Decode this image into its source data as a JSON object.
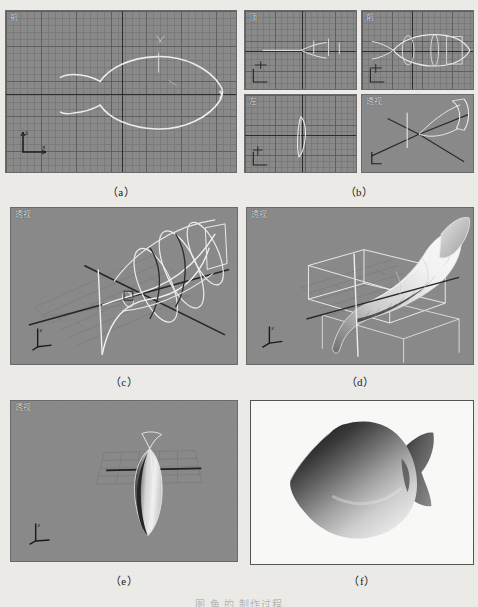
{
  "figure": {
    "panels": [
      {
        "id": "a",
        "caption": "（a）",
        "viewport_label": "前",
        "view_type": "front-orthographic",
        "description": "Front view showing fish outline spline on grid with X/Y axes"
      },
      {
        "id": "b",
        "caption": "（b）",
        "view_type": "four-viewport",
        "quadrants": [
          {
            "label": "顶",
            "name": "top-viewport"
          },
          {
            "label": "前",
            "name": "front-viewport"
          },
          {
            "label": "左",
            "name": "left-viewport"
          },
          {
            "label": "透视",
            "name": "perspective-viewport"
          }
        ],
        "description": "Four-viewport layout: top, front, left and perspective views of the loft cross-sections"
      },
      {
        "id": "c",
        "caption": "（c）",
        "viewport_label": "透视",
        "view_type": "perspective",
        "description": "Perspective wireframe of loft path with cross-section shapes"
      },
      {
        "id": "d",
        "caption": "（d）",
        "viewport_label": "透视",
        "view_type": "perspective",
        "description": "Perspective shaded loft surface with bounding box gizmo"
      },
      {
        "id": "e",
        "caption": "（e）",
        "viewport_label": "透视",
        "view_type": "perspective",
        "description": "Perspective shaded narrow fish body seen edge-on"
      },
      {
        "id": "f",
        "caption": "（f）",
        "view_type": "render-output",
        "description": "Final rendered grayscale fish model on white background"
      }
    ]
  },
  "colors": {
    "paper": "#eeedea",
    "viewport_bg": "#8b8b8b",
    "grid_line": "#787878",
    "axis_line": "#2c2c2c",
    "spline": "#f2f2f2",
    "label_text": "#e6e6e6",
    "caption_text": "#1a1a1a",
    "render_bg": "#fbfbf9",
    "render_frame": "#555555"
  },
  "bottom_note": {
    "text": "图 鱼 的 制作过程"
  }
}
